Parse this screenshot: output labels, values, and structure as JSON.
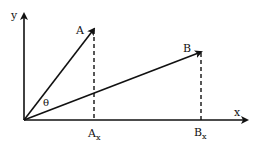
{
  "diagram": {
    "axes": {
      "x_label": "x",
      "y_label": "y"
    },
    "vectors": [
      {
        "name": "A",
        "label": "A",
        "projection_label": "A",
        "projection_sub": "x"
      },
      {
        "name": "B",
        "label": "B",
        "projection_label": "B",
        "projection_sub": "x"
      }
    ],
    "angle_label": "θ",
    "colors": {
      "stroke": "#111111",
      "background": "#ffffff"
    }
  }
}
